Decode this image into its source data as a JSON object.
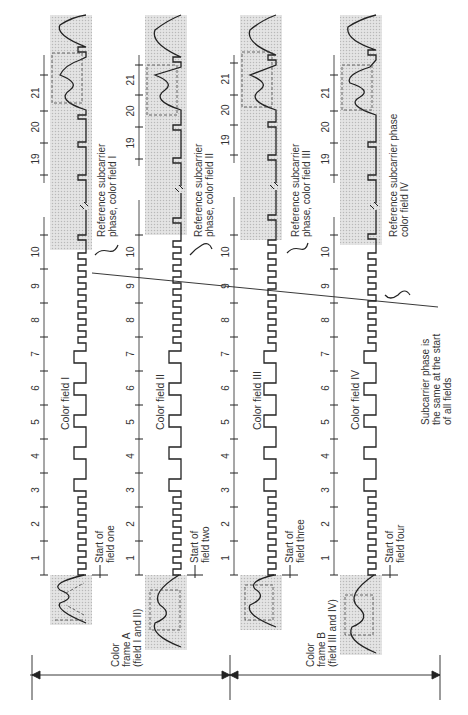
{
  "diagram": {
    "type": "NTSC four-field color sequence (vertical interval waveforms)",
    "frames": [
      {
        "id": "A",
        "label_line1": "Color",
        "label_line2": "frame A",
        "label_line3": "(field I and II)"
      },
      {
        "id": "B",
        "label_line1": "Color",
        "label_line2": "frame B",
        "label_line3": "(field III and IV)"
      }
    ],
    "fields": [
      {
        "id": "I",
        "title": "Color field I",
        "start_label_line1": "Start of",
        "start_label_line2": "field one",
        "ref_label_line1": "Reference subcarrier",
        "ref_label_line2": "phase, color field I"
      },
      {
        "id": "II",
        "title": "Color field II",
        "start_label_line1": "Start of",
        "start_label_line2": "field two",
        "ref_label_line1": "Reference subcarrier",
        "ref_label_line2": "phase, color field II"
      },
      {
        "id": "III",
        "title": "Color field III",
        "start_label_line1": "Start of",
        "start_label_line2": "field three",
        "ref_label_line1": "Reference subcarrier",
        "ref_label_line2": "phase, color field III"
      },
      {
        "id": "IV",
        "title": "Color field IV",
        "start_label_line1": "Start of",
        "start_label_line2": "field four",
        "ref_label_line1": "Reference subcarrier phase",
        "ref_label_line2": "color field IV"
      }
    ],
    "line_numbers": [
      "1",
      "2",
      "3",
      "4",
      "5",
      "6",
      "7",
      "8",
      "9",
      "10",
      "19",
      "20",
      "21"
    ],
    "annotation": {
      "line1": "Subcarrier phase is",
      "line2": "the same at the start",
      "line3": "of all fields"
    },
    "colors": {
      "ink": "#222222",
      "shade": "#d9d9d9",
      "background": "#ffffff"
    }
  }
}
